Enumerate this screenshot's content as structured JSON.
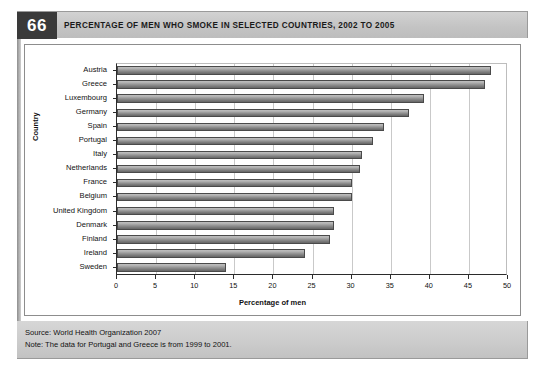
{
  "figure": {
    "number": "66",
    "title": "PERCENTAGE OF MEN WHO SMOKE IN SELECTED COUNTRIES, 2002 TO 2005",
    "source": "Source: World Health Organization 2007",
    "note": "Note: The data for Portugal and Greece is from 1999 to 2001."
  },
  "chart_data": {
    "type": "bar",
    "orientation": "horizontal",
    "title": "PERCENTAGE OF MEN WHO SMOKE IN SELECTED COUNTRIES, 2002 TO 2005",
    "xlabel": "Percentage of men",
    "ylabel": "Country",
    "categories": [
      "Austria",
      "Greece",
      "Luxembourg",
      "Germany",
      "Spain",
      "Portugal",
      "Italy",
      "Netherlands",
      "France",
      "Belgium",
      "United Kingdom",
      "Denmark",
      "Finland",
      "Ireland",
      "Sweden"
    ],
    "values": [
      47.8,
      47.0,
      39.3,
      37.3,
      34.2,
      32.8,
      31.3,
      31.1,
      30.0,
      30.0,
      27.8,
      27.8,
      27.2,
      24.1,
      13.9
    ],
    "xlim": [
      0,
      50
    ],
    "xticks": [
      0,
      5,
      10,
      15,
      20,
      25,
      30,
      35,
      40,
      45,
      50
    ],
    "grid": true,
    "legend": false,
    "bar_color": "#8f8f8f"
  }
}
